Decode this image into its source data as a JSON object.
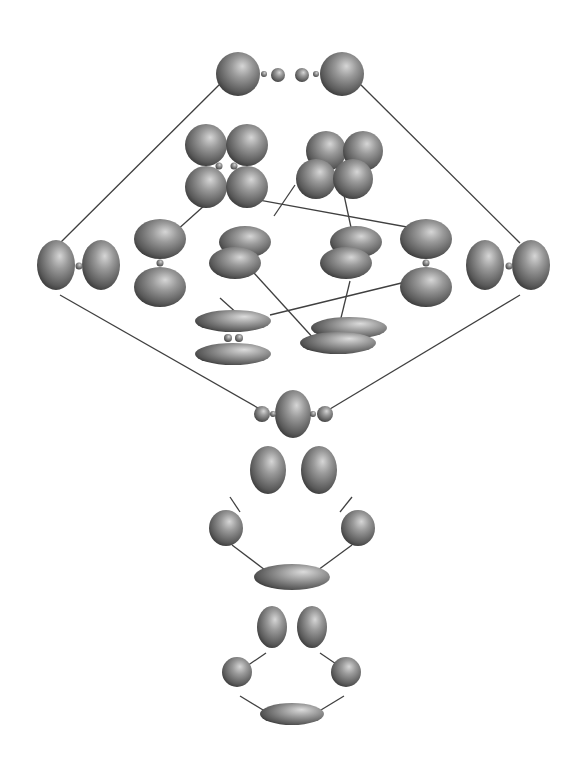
{
  "diagram": {
    "title": "",
    "background": "#ffffff",
    "colors": {
      "lobe_light": "#c8c8c8",
      "lobe_mid": "#8a8a8a",
      "lobe_dark": "#3c3c3c",
      "line": "#404040"
    },
    "lines": [
      [
        220,
        84,
        60,
        243
      ],
      [
        360,
        84,
        520,
        243
      ],
      [
        60,
        295,
        265,
        412
      ],
      [
        520,
        295,
        325,
        412
      ],
      [
        176,
        231,
        215,
        196
      ],
      [
        274,
        216,
        295,
        185
      ],
      [
        242,
        197,
        440,
        233
      ],
      [
        344,
        195,
        352,
        232
      ],
      [
        220,
        298,
        240,
        316
      ],
      [
        422,
        278,
        270,
        315
      ],
      [
        254,
        273,
        315,
        340
      ],
      [
        350,
        281,
        340,
        322
      ],
      [
        230,
        497,
        240,
        512
      ],
      [
        352,
        497,
        340,
        512
      ],
      [
        232,
        545,
        265,
        570
      ],
      [
        352,
        545,
        318,
        570
      ],
      [
        266,
        653,
        244,
        668
      ],
      [
        320,
        653,
        342,
        668
      ],
      [
        240,
        696,
        268,
        713
      ],
      [
        344,
        696,
        316,
        713
      ]
    ],
    "shapes": [
      {
        "name": "top-left-sphere",
        "cx": 238,
        "cy": 74,
        "rx": 22,
        "ry": 22
      },
      {
        "name": "top-right-sphere",
        "cx": 342,
        "cy": 74,
        "rx": 22,
        "ry": 22
      },
      {
        "name": "top-small-left",
        "cx": 278,
        "cy": 75,
        "rx": 7,
        "ry": 7
      },
      {
        "name": "top-small-right",
        "cx": 302,
        "cy": 75,
        "rx": 7,
        "ry": 7
      },
      {
        "name": "cluster-a-tl",
        "cx": 206,
        "cy": 145,
        "rx": 21,
        "ry": 21
      },
      {
        "name": "cluster-a-tr",
        "cx": 247,
        "cy": 145,
        "rx": 21,
        "ry": 21
      },
      {
        "name": "cluster-a-bl",
        "cx": 206,
        "cy": 187,
        "rx": 21,
        "ry": 21
      },
      {
        "name": "cluster-a-br",
        "cx": 247,
        "cy": 187,
        "rx": 21,
        "ry": 21
      },
      {
        "name": "cluster-b-tl",
        "cx": 326,
        "cy": 151,
        "rx": 20,
        "ry": 20
      },
      {
        "name": "cluster-b-tr",
        "cx": 363,
        "cy": 151,
        "rx": 20,
        "ry": 20
      },
      {
        "name": "cluster-b-bl",
        "cx": 316,
        "cy": 179,
        "rx": 20,
        "ry": 20
      },
      {
        "name": "cluster-b-br",
        "cx": 353,
        "cy": 179,
        "rx": 20,
        "ry": 20
      },
      {
        "name": "left-lobe-outer",
        "cx": 56,
        "cy": 265,
        "rx": 19,
        "ry": 25
      },
      {
        "name": "left-lobe-inner",
        "cx": 101,
        "cy": 265,
        "rx": 19,
        "ry": 25
      },
      {
        "name": "right-lobe-inner",
        "cx": 485,
        "cy": 265,
        "rx": 19,
        "ry": 25
      },
      {
        "name": "right-lobe-outer",
        "cx": 531,
        "cy": 265,
        "rx": 19,
        "ry": 25
      },
      {
        "name": "dz-left-top",
        "cx": 160,
        "cy": 239,
        "rx": 26,
        "ry": 20
      },
      {
        "name": "dz-left-bottom",
        "cx": 160,
        "cy": 287,
        "rx": 26,
        "ry": 20
      },
      {
        "name": "dz-right-top",
        "cx": 426,
        "cy": 239,
        "rx": 26,
        "ry": 20
      },
      {
        "name": "dz-right-bottom",
        "cx": 426,
        "cy": 287,
        "rx": 26,
        "ry": 20
      },
      {
        "name": "pair-a-back",
        "cx": 245,
        "cy": 242,
        "rx": 26,
        "ry": 16
      },
      {
        "name": "pair-a-front",
        "cx": 235,
        "cy": 263,
        "rx": 26,
        "ry": 16
      },
      {
        "name": "pair-b-back",
        "cx": 356,
        "cy": 242,
        "rx": 26,
        "ry": 16
      },
      {
        "name": "pair-b-front",
        "cx": 346,
        "cy": 263,
        "rx": 26,
        "ry": 16
      },
      {
        "name": "flat-left-top",
        "cx": 233,
        "cy": 321,
        "rx": 38,
        "ry": 11
      },
      {
        "name": "flat-left-bottom",
        "cx": 233,
        "cy": 354,
        "rx": 38,
        "ry": 11
      },
      {
        "name": "flat-right-back",
        "cx": 349,
        "cy": 328,
        "rx": 38,
        "ry": 11
      },
      {
        "name": "flat-right-front",
        "cx": 338,
        "cy": 343,
        "rx": 38,
        "ry": 11
      },
      {
        "name": "center-lobe",
        "cx": 293,
        "cy": 414,
        "rx": 18,
        "ry": 24
      },
      {
        "name": "center-small-left",
        "cx": 262,
        "cy": 414,
        "rx": 8,
        "ry": 8
      },
      {
        "name": "center-small-right",
        "cx": 325,
        "cy": 414,
        "rx": 8,
        "ry": 8
      },
      {
        "name": "ring1-top-left",
        "cx": 268,
        "cy": 470,
        "rx": 18,
        "ry": 24
      },
      {
        "name": "ring1-top-right",
        "cx": 319,
        "cy": 470,
        "rx": 18,
        "ry": 24
      },
      {
        "name": "ring1-mid-left",
        "cx": 226,
        "cy": 528,
        "rx": 17,
        "ry": 18
      },
      {
        "name": "ring1-mid-right",
        "cx": 358,
        "cy": 528,
        "rx": 17,
        "ry": 18
      },
      {
        "name": "ring1-bottom",
        "cx": 292,
        "cy": 577,
        "rx": 38,
        "ry": 13
      },
      {
        "name": "ring2-top-left",
        "cx": 272,
        "cy": 627,
        "rx": 15,
        "ry": 21
      },
      {
        "name": "ring2-top-right",
        "cx": 312,
        "cy": 627,
        "rx": 15,
        "ry": 21
      },
      {
        "name": "ring2-mid-left",
        "cx": 237,
        "cy": 672,
        "rx": 15,
        "ry": 15
      },
      {
        "name": "ring2-mid-right",
        "cx": 346,
        "cy": 672,
        "rx": 15,
        "ry": 15
      },
      {
        "name": "ring2-bottom",
        "cx": 292,
        "cy": 714,
        "rx": 32,
        "ry": 11
      }
    ],
    "nodes": [
      {
        "name": "top-tiny-left",
        "cx": 264,
        "cy": 74,
        "r": 3
      },
      {
        "name": "top-tiny-right",
        "cx": 316,
        "cy": 74,
        "r": 3
      },
      {
        "name": "cluster-a-node-left",
        "cx": 219,
        "cy": 166,
        "r": 3.5
      },
      {
        "name": "cluster-a-node-right",
        "cx": 234,
        "cy": 166,
        "r": 3.5
      },
      {
        "name": "left-lobe-node",
        "cx": 79,
        "cy": 266,
        "r": 3.5
      },
      {
        "name": "right-lobe-node",
        "cx": 509,
        "cy": 266,
        "r": 3.5
      },
      {
        "name": "dz-left-node",
        "cx": 160,
        "cy": 263,
        "r": 3.5
      },
      {
        "name": "dz-right-node",
        "cx": 426,
        "cy": 263,
        "r": 3.5
      },
      {
        "name": "flat-left-node-a",
        "cx": 228,
        "cy": 338,
        "r": 4
      },
      {
        "name": "flat-left-node-b",
        "cx": 239,
        "cy": 338,
        "r": 4
      },
      {
        "name": "center-tiny-left",
        "cx": 273,
        "cy": 414,
        "r": 3
      },
      {
        "name": "center-tiny-right",
        "cx": 313,
        "cy": 414,
        "r": 3
      }
    ]
  }
}
